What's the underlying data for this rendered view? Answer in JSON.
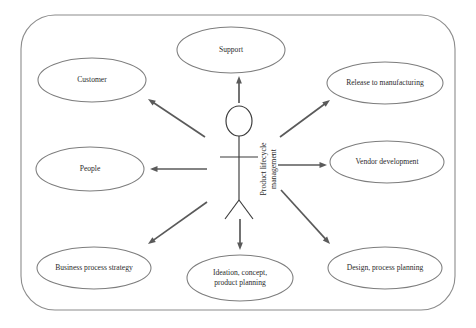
{
  "diagram": {
    "type": "uml-use-case-diagram",
    "title_present": false,
    "system_boundary": {
      "name": "system-boundary",
      "label": "",
      "x": 21,
      "y": 15,
      "width": 434,
      "height": 295,
      "corner_radius": 34,
      "stroke_color": "#8c8c8c"
    },
    "actor": {
      "name": "actor-product-lifecycle-management",
      "label_line1": "Product lifecycle",
      "label_line2": "management",
      "label_rotation_deg": -90,
      "center_x": 239,
      "head_cy": 121,
      "head_rx": 13,
      "head_ry": 15
    },
    "use_cases": [
      {
        "id": "support",
        "name": "use-case-support",
        "lines": [
          "Support"
        ],
        "cx": 231,
        "cy": 50,
        "rx": 54,
        "ry": 23
      },
      {
        "id": "customer",
        "name": "use-case-customer",
        "lines": [
          "Customer"
        ],
        "cx": 92,
        "cy": 80,
        "rx": 54,
        "ry": 22
      },
      {
        "id": "release-to-manufacturing",
        "name": "use-case-release-to-manufacturing",
        "lines": [
          "Release to manufacturing"
        ],
        "cx": 385,
        "cy": 83,
        "rx": 58,
        "ry": 21
      },
      {
        "id": "people",
        "name": "use-case-people",
        "lines": [
          "People"
        ],
        "cx": 90,
        "cy": 169,
        "rx": 54,
        "ry": 22
      },
      {
        "id": "vendor-development",
        "name": "use-case-vendor-development",
        "lines": [
          "Vendor development"
        ],
        "cx": 387,
        "cy": 162,
        "rx": 57,
        "ry": 21
      },
      {
        "id": "business-process-strategy",
        "name": "use-case-business-process-strategy",
        "lines": [
          "Business process strategy"
        ],
        "cx": 94,
        "cy": 268,
        "rx": 57,
        "ry": 21
      },
      {
        "id": "ideation-concept-product-planning",
        "name": "use-case-ideation-concept-product-planning",
        "lines": [
          "Ideation, concept,",
          "product planning"
        ],
        "cx": 240,
        "cy": 278,
        "rx": 53,
        "ry": 23
      },
      {
        "id": "design-process-planning",
        "name": "use-case-design-process-planning",
        "lines": [
          "Design, process planning"
        ],
        "cx": 385,
        "cy": 268,
        "rx": 57,
        "ry": 21
      }
    ],
    "associations": [
      {
        "id": "assoc-support",
        "name": "association-actor-to-support",
        "from": "actor",
        "to": "support",
        "x1": 239,
        "y1": 103,
        "x2": 239,
        "y2": 76
      },
      {
        "id": "assoc-customer",
        "name": "association-actor-to-customer",
        "from": "actor",
        "to": "customer",
        "x1": 205,
        "y1": 137,
        "x2": 148,
        "y2": 99
      },
      {
        "id": "assoc-release",
        "name": "association-actor-to-release-to-manufacturing",
        "from": "actor",
        "to": "release-to-manufacturing",
        "x1": 280,
        "y1": 137,
        "x2": 330,
        "y2": 100
      },
      {
        "id": "assoc-people",
        "name": "association-actor-to-people",
        "from": "actor",
        "to": "people",
        "x1": 207,
        "y1": 169,
        "x2": 150,
        "y2": 169
      },
      {
        "id": "assoc-vendor",
        "name": "association-actor-to-vendor-development",
        "from": "actor",
        "to": "vendor-development",
        "x1": 278,
        "y1": 165,
        "x2": 327,
        "y2": 165
      },
      {
        "id": "assoc-business",
        "name": "association-actor-to-business-process-strategy",
        "from": "actor",
        "to": "business-process-strategy",
        "x1": 207,
        "y1": 202,
        "x2": 148,
        "y2": 244
      },
      {
        "id": "assoc-ideation",
        "name": "association-actor-to-ideation-concept-product-planning",
        "from": "actor",
        "to": "ideation-concept-product-planning",
        "x1": 240,
        "y1": 219,
        "x2": 240,
        "y2": 250
      },
      {
        "id": "assoc-design",
        "name": "association-actor-to-design-process-planning",
        "from": "actor",
        "to": "design-process-planning",
        "x1": 281,
        "y1": 190,
        "x2": 330,
        "y2": 244
      }
    ],
    "colors": {
      "background": "#ffffff",
      "boundary_stroke": "#8c8c8c",
      "ellipse_stroke": "#7d7d7d",
      "arrow_stroke": "#5a5a5a",
      "text": "#2b2b2b"
    }
  }
}
